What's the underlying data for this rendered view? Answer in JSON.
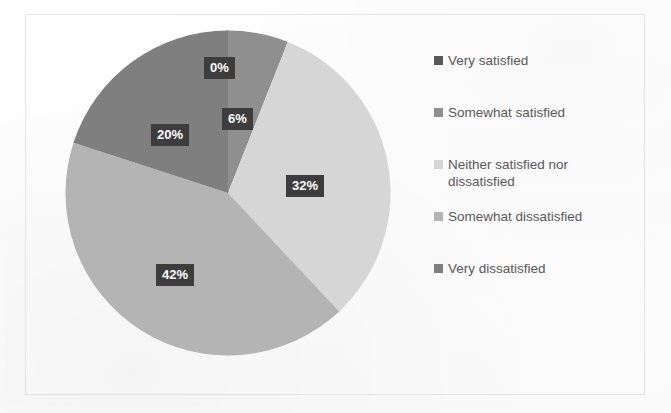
{
  "chart_data": {
    "type": "pie",
    "title": "",
    "subtitle": "",
    "xlabel": "",
    "ylabel": "",
    "grid": false,
    "legend_position": "right",
    "categories": [
      "Very satisfied",
      "Somewhat satisfied",
      "Neither satisfied nor dissatisfied",
      "Somewhat dissatisfied",
      "Very dissatisfied"
    ],
    "values": [
      0,
      6,
      32,
      42,
      20
    ],
    "data_labels": [
      "0%",
      "6%",
      "32%",
      "42%",
      "20%"
    ],
    "colors": [
      "#595959",
      "#8f8f8f",
      "#d6d6d6",
      "#b4b4b4",
      "#7f7f7f"
    ],
    "start_angle_deg": 0,
    "direction": "clockwise",
    "units": "percent",
    "label_box_color": "#3d3d3d",
    "label_text_color": "#ffffff"
  },
  "pie": {
    "slices": [
      {
        "label": "Very satisfied",
        "value": 0,
        "display": "0%",
        "color": "#595959"
      },
      {
        "label": "Somewhat satisfied",
        "value": 6,
        "display": "6%",
        "color": "#8f8f8f"
      },
      {
        "label": "Neither satisfied nor dissatisfied",
        "value": 32,
        "display": "32%",
        "color": "#d6d6d6"
      },
      {
        "label": "Somewhat dissatisfied",
        "value": 42,
        "display": "42%",
        "color": "#b4b4b4"
      },
      {
        "label": "Very dissatisfied",
        "value": 20,
        "display": "20%",
        "color": "#7f7f7f"
      }
    ],
    "labels": [
      {
        "text": "0%",
        "x": 204,
        "y": 57
      },
      {
        "text": "6%",
        "x": 222,
        "y": 108
      },
      {
        "text": "32%",
        "x": 286,
        "y": 175
      },
      {
        "text": "42%",
        "x": 156,
        "y": 264
      },
      {
        "text": "20%",
        "x": 151,
        "y": 124
      }
    ]
  },
  "legend": {
    "entries": [
      {
        "label": "Very satisfied",
        "color": "#595959",
        "top": 0
      },
      {
        "label": "Somewhat satisfied",
        "color": "#8f8f8f",
        "top": 52
      },
      {
        "label": "Neither satisfied nor dissatisfied",
        "color": "#d6d6d6",
        "top": 104
      },
      {
        "label": "Somewhat dissatisfied",
        "color": "#b4b4b4",
        "top": 156
      },
      {
        "label": "Very dissatisfied",
        "color": "#7f7f7f",
        "top": 208
      }
    ]
  },
  "frame": {
    "border_color": "#e3e3e3",
    "background": "#fdfdfd"
  }
}
